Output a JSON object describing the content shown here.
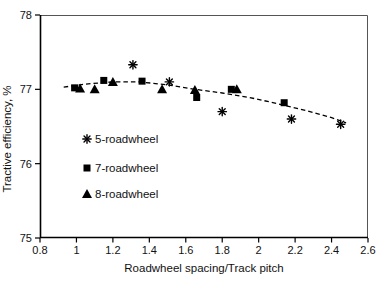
{
  "figure": {
    "background": "#ffffff",
    "axis_color": "#000000",
    "border_color": "#555555",
    "marker_color": "#000000"
  },
  "chart_data": {
    "type": "scatter",
    "title": "",
    "xlabel": "Roadwheel spacing/Track pitch",
    "ylabel": "Tractive efficiency, %",
    "xlim": [
      0.8,
      2.6
    ],
    "ylim": [
      75,
      78
    ],
    "grid": false,
    "legend_position": "inside-left",
    "x_ticks": [
      "0.8",
      "1",
      "1.2",
      "1.4",
      "1.6",
      "1.8",
      "2",
      "2.2",
      "2.4",
      "2.6"
    ],
    "x_tick_values": [
      0.8,
      1.0,
      1.2,
      1.4,
      1.6,
      1.8,
      2.0,
      2.2,
      2.4,
      2.6
    ],
    "y_ticks": [
      "75",
      "76",
      "77",
      "78"
    ],
    "y_tick_values": [
      75,
      76,
      77,
      78
    ],
    "series": [
      {
        "name": "5-roadwheel",
        "marker": "asterisk",
        "points": [
          [
            1.31,
            77.33
          ],
          [
            1.51,
            77.1
          ],
          [
            1.8,
            76.7
          ],
          [
            2.18,
            76.6
          ],
          [
            2.45,
            76.53
          ]
        ]
      },
      {
        "name": "7-roadwheel",
        "marker": "square",
        "points": [
          [
            0.99,
            77.02
          ],
          [
            1.15,
            77.12
          ],
          [
            1.36,
            77.11
          ],
          [
            1.66,
            76.89
          ],
          [
            1.85,
            77.0
          ],
          [
            2.14,
            76.82
          ]
        ]
      },
      {
        "name": "8-roadwheel",
        "marker": "triangle",
        "points": [
          [
            1.02,
            77.01
          ],
          [
            1.1,
            77.0
          ],
          [
            1.2,
            77.1
          ],
          [
            1.47,
            77.0
          ],
          [
            1.65,
            76.99
          ],
          [
            1.88,
            77.0
          ]
        ]
      }
    ],
    "trend": {
      "style": "dashed",
      "points": [
        [
          0.93,
          77.03
        ],
        [
          1.05,
          77.07
        ],
        [
          1.2,
          77.1
        ],
        [
          1.35,
          77.1
        ],
        [
          1.5,
          77.06
        ],
        [
          1.65,
          77.0
        ],
        [
          1.8,
          76.95
        ],
        [
          1.95,
          76.89
        ],
        [
          2.1,
          76.81
        ],
        [
          2.25,
          76.72
        ],
        [
          2.4,
          76.62
        ],
        [
          2.48,
          76.55
        ]
      ]
    }
  }
}
